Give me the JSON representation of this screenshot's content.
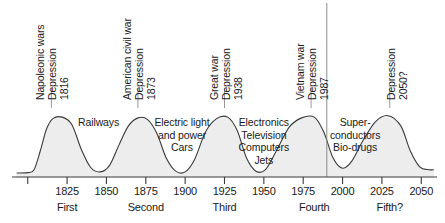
{
  "chart_data": {
    "type": "area",
    "title": "",
    "subtitle": "",
    "xlabel": "",
    "ylabel": "",
    "xlim": [
      1790,
      2060
    ],
    "ylim": [
      0,
      1
    ],
    "grid": false,
    "legend": null,
    "x_ticks": [
      {
        "value": 1825,
        "label": "1825"
      },
      {
        "value": 1850,
        "label": "1850"
      },
      {
        "value": 1875,
        "label": "1875"
      },
      {
        "value": 1900,
        "label": "1900"
      },
      {
        "value": 1925,
        "label": "1925"
      },
      {
        "value": 1950,
        "label": "1950"
      },
      {
        "value": 1975,
        "label": "1975"
      },
      {
        "value": 2000,
        "label": "2000"
      },
      {
        "value": 2025,
        "label": "2025"
      },
      {
        "value": 2050,
        "label": "2050"
      }
    ],
    "unlabeled_ticks": [
      1800
    ],
    "waves": [
      {
        "name": "First",
        "label": "First",
        "center_year": 1825,
        "peak_year": 1815,
        "trough_year": 1845
      },
      {
        "name": "Second",
        "label": "Second",
        "center_year": 1875,
        "peak_year": 1870,
        "trough_year": 1896
      },
      {
        "name": "Third",
        "label": "Third",
        "center_year": 1925,
        "peak_year": 1925,
        "trough_year": 1946
      },
      {
        "name": "Fourth",
        "label": "Fourth",
        "center_year": 1982,
        "peak_year": 1980,
        "trough_year": 2000
      },
      {
        "name": "Fifth?",
        "label": "Fifth?",
        "center_year": 2030,
        "peak_year": 2030,
        "trough_year": 2050
      }
    ],
    "peak_events": [
      {
        "war": "Napoleonic wars",
        "depression": "Depression",
        "year": "1816"
      },
      {
        "war": "American civil war",
        "depression": "Depression",
        "year": "1873"
      },
      {
        "war": "Great war",
        "depression": "Depression",
        "year": "1938"
      },
      {
        "war": "Vietnam war",
        "depression": "Depression",
        "year": "1987"
      },
      {
        "war": "",
        "depression": "Depression",
        "year": "2050?"
      }
    ],
    "innovation_labels": [
      {
        "lines": [
          "Railways"
        ],
        "year": 1845
      },
      {
        "lines": [
          "Electric light",
          "and power",
          "Cars"
        ],
        "year": 1898
      },
      {
        "lines": [
          "Electronics",
          "Television",
          "Computers",
          "Jets"
        ],
        "year": 1950
      },
      {
        "lines": [
          "Super-",
          "conductors",
          "Bio-drugs"
        ],
        "year": 2008
      }
    ],
    "present_marker_year": 1990,
    "curve_points": [
      {
        "x": 1793,
        "y": 0.055
      },
      {
        "x": 1800,
        "y": 0.06
      },
      {
        "x": 1804,
        "y": 0.1
      },
      {
        "x": 1808,
        "y": 0.36
      },
      {
        "x": 1812,
        "y": 0.66
      },
      {
        "x": 1816,
        "y": 0.8
      },
      {
        "x": 1822,
        "y": 0.82
      },
      {
        "x": 1828,
        "y": 0.72
      },
      {
        "x": 1834,
        "y": 0.38
      },
      {
        "x": 1840,
        "y": 0.13
      },
      {
        "x": 1846,
        "y": 0.07
      },
      {
        "x": 1852,
        "y": 0.16
      },
      {
        "x": 1858,
        "y": 0.44
      },
      {
        "x": 1864,
        "y": 0.7
      },
      {
        "x": 1870,
        "y": 0.81
      },
      {
        "x": 1876,
        "y": 0.79
      },
      {
        "x": 1882,
        "y": 0.6
      },
      {
        "x": 1888,
        "y": 0.26
      },
      {
        "x": 1894,
        "y": 0.08
      },
      {
        "x": 1900,
        "y": 0.07
      },
      {
        "x": 1906,
        "y": 0.24
      },
      {
        "x": 1913,
        "y": 0.62
      },
      {
        "x": 1920,
        "y": 0.8
      },
      {
        "x": 1927,
        "y": 0.82
      },
      {
        "x": 1933,
        "y": 0.64
      },
      {
        "x": 1939,
        "y": 0.26
      },
      {
        "x": 1945,
        "y": 0.08
      },
      {
        "x": 1951,
        "y": 0.1
      },
      {
        "x": 1958,
        "y": 0.36
      },
      {
        "x": 1966,
        "y": 0.68
      },
      {
        "x": 1974,
        "y": 0.81
      },
      {
        "x": 1982,
        "y": 0.82
      },
      {
        "x": 1988,
        "y": 0.62
      },
      {
        "x": 1994,
        "y": 0.26
      },
      {
        "x": 2000,
        "y": 0.12
      },
      {
        "x": 2006,
        "y": 0.22
      },
      {
        "x": 2013,
        "y": 0.5
      },
      {
        "x": 2021,
        "y": 0.76
      },
      {
        "x": 2029,
        "y": 0.84
      },
      {
        "x": 2037,
        "y": 0.7
      },
      {
        "x": 2043,
        "y": 0.36
      },
      {
        "x": 2049,
        "y": 0.14
      },
      {
        "x": 2055,
        "y": 0.1
      },
      {
        "x": 2058,
        "y": 0.1
      }
    ],
    "colors": {
      "fill": "#ededed",
      "stroke": "#3a3a3a",
      "axis": "#3a3a3a",
      "text": "#1a1a1a",
      "marker": "#8c8c8c"
    }
  }
}
